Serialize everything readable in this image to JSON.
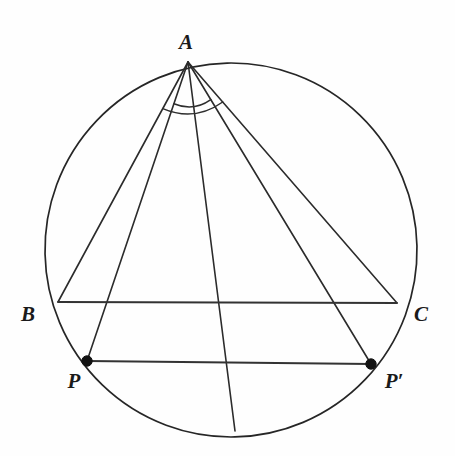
{
  "figure": {
    "background_color": "#fefefe",
    "stroke_color": "#2b2b2b",
    "labels": {
      "A": "A",
      "B": "B",
      "C": "C",
      "P": "P",
      "P_prime": "P′"
    },
    "label_positions": {
      "A": {
        "x": 186,
        "y": 42
      },
      "B": {
        "x": 28,
        "y": 314
      },
      "C": {
        "x": 421,
        "y": 314
      },
      "P": {
        "x": 74,
        "y": 381
      },
      "P_prime": {
        "x": 394,
        "y": 381
      }
    }
  },
  "geometry": {
    "circle": {
      "name": "circumcircle",
      "center": {
        "x": 231,
        "y": 250
      },
      "radius": 186
    },
    "points": [
      {
        "id": "A",
        "label": "A",
        "x": 188,
        "y": 62,
        "marked": false
      },
      {
        "id": "B",
        "label": "B",
        "x": 58,
        "y": 302,
        "marked": false
      },
      {
        "id": "C",
        "label": "C",
        "x": 397,
        "y": 303,
        "marked": false
      },
      {
        "id": "P",
        "label": "P",
        "x": 87,
        "y": 361,
        "marked": true
      },
      {
        "id": "Pp",
        "label": "P′",
        "x": 371,
        "y": 364,
        "marked": true
      },
      {
        "id": "M",
        "label": "",
        "x": 235,
        "y": 431,
        "marked": false
      }
    ],
    "segments": [
      {
        "id": "AB",
        "from": "A",
        "to": "B",
        "kind": "side"
      },
      {
        "id": "AC",
        "from": "A",
        "to": "C",
        "kind": "side"
      },
      {
        "id": "BC",
        "from": "B",
        "to": "C",
        "kind": "side"
      },
      {
        "id": "AP",
        "from": "A",
        "to": "P",
        "kind": "cevian"
      },
      {
        "id": "APp",
        "from": "A",
        "to": "Pp",
        "kind": "cevian"
      },
      {
        "id": "AM",
        "from": "A",
        "to": "M",
        "kind": "bisector"
      },
      {
        "id": "PPp",
        "from": "P",
        "to": "Pp",
        "kind": "chord"
      }
    ],
    "angle_arcs": [
      {
        "id": "arc-inner",
        "vertex": "A",
        "radius": 44,
        "from_ray": "AP",
        "to_ray": "APp"
      },
      {
        "id": "arc-outer",
        "vertex": "A",
        "radius": 53,
        "from_ray": "AB",
        "to_ray": "AC"
      }
    ]
  }
}
